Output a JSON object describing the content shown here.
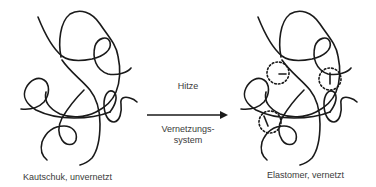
{
  "diagram": {
    "left_state": {
      "caption": "Kautschuk, unvernetzt",
      "crosslinks": 0
    },
    "process": {
      "arrow_direction": "right",
      "label_above": "Hitze",
      "label_below_line1": "Vernetzungs-",
      "label_below_line2": "system"
    },
    "right_state": {
      "caption": "Elastomer, vernetzt",
      "crosslinks": 3
    },
    "colors": {
      "stroke": "#1a1a1a",
      "text": "#3a3a3a",
      "background": "#ffffff"
    }
  }
}
